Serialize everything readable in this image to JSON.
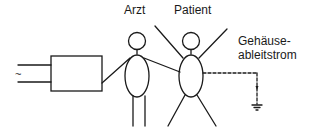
{
  "diagram": {
    "labels": {
      "doctor": "Arzt",
      "patient": "Patient",
      "leakage_line1": "Gehäuse-",
      "leakage_line2": "ableitstrom",
      "ac_symbol": "~"
    },
    "colors": {
      "stroke": "#1a1a1a",
      "background": "#ffffff"
    },
    "elements": [
      {
        "id": "ac-supply",
        "type": "two-wire input",
        "symbol": "~"
      },
      {
        "id": "device",
        "type": "rectangle box"
      },
      {
        "id": "doctor",
        "type": "stick figure",
        "label": "Arzt",
        "touches": [
          "device",
          "patient"
        ]
      },
      {
        "id": "patient",
        "type": "stick figure",
        "label": "Patient"
      },
      {
        "id": "leakage-path",
        "type": "dashed line",
        "label": "Gehäuseableitstrom",
        "to": "ground"
      },
      {
        "id": "ground",
        "type": "ground symbol"
      }
    ]
  }
}
